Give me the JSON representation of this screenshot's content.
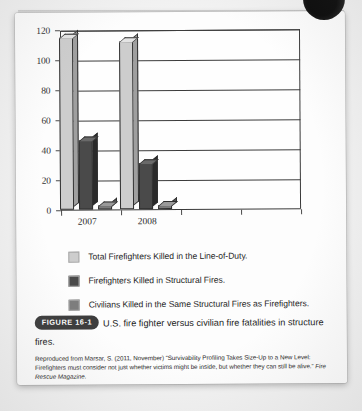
{
  "page": {
    "background_color": "#f2f2f2",
    "sheet_color": "#fdfdfd"
  },
  "chart_data": {
    "type": "bar",
    "title": "",
    "subtitle": "",
    "xlabel": "",
    "ylabel": "",
    "categories": [
      "2007",
      "2008"
    ],
    "empty_category_slots": 2,
    "series": [
      {
        "name": "Total Firefighters Killed in the Line-of-Duty.",
        "color": "#cdcdcd",
        "values": [
          115,
          112
        ]
      },
      {
        "name": "Firefighters Killed in Structural Fires.",
        "color": "#4a4a4a",
        "values": [
          46,
          31
        ]
      },
      {
        "name": "Civilians Killed in the Same Structural Fires as Firefighters.",
        "color": "#7d7d7d",
        "values": [
          3,
          3
        ]
      }
    ],
    "ylim": [
      0,
      120
    ],
    "ytick_values": [
      0,
      20,
      40,
      60,
      80,
      100,
      120
    ],
    "ytick_labels": [
      "0",
      "20",
      "40",
      "60",
      "80",
      "100",
      "120"
    ],
    "grid": true,
    "grid_axis": "y",
    "legend_position": "below",
    "style": "3d-column"
  },
  "legend": {
    "items": [
      {
        "label": "Total Firefighters Killed in the Line-of-Duty.",
        "color": "#cdcdcd"
      },
      {
        "label": "Firefighters Killed in Structural Fires.",
        "color": "#4a4a4a"
      },
      {
        "label": "Civilians Killed in the Same Structural Fires as Firefighters.",
        "color": "#7d7d7d"
      }
    ]
  },
  "caption": {
    "badge": "FIGURE 16-1",
    "text": "U.S. fire fighter versus civilian fire fatalities in structure fires.",
    "credit_line_1": "Reproduced from Marsar, S. (2011, November) “Survivability Profiling Takes Size-Up to a New Level:",
    "credit_line_2": "Firefighters must consider not just whether victims might be inside, but whether they can still be",
    "credit_line_3_plain": "alive.” ",
    "credit_line_3_italic": "Fire Rescue Magazine."
  },
  "decoration": {
    "corner_blob": "dark-circle-blob"
  }
}
